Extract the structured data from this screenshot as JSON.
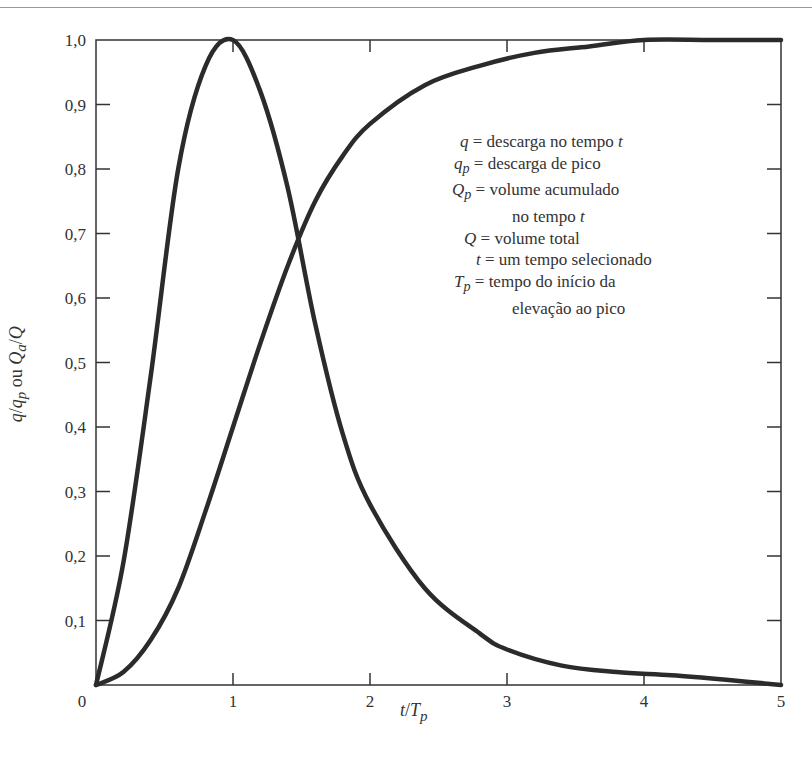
{
  "chart_data": {
    "type": "line",
    "title": "",
    "xlabel": "t/T_p",
    "ylabel": "q/q_p ou Q_a/Q",
    "xlim": [
      0,
      5
    ],
    "ylim": [
      0,
      1.0
    ],
    "grid": false,
    "x_ticks": [
      "0",
      "1",
      "2",
      "3",
      "4",
      "5"
    ],
    "y_ticks": [
      "0,1",
      "0,2",
      "0,3",
      "0,4",
      "0,5",
      "0,6",
      "0,7",
      "0,8",
      "0,9",
      "1,0"
    ],
    "series": [
      {
        "name": "q/q_p (hidrograma unitário adimensional)",
        "x": [
          0,
          0.2,
          0.4,
          0.6,
          0.8,
          1.0,
          1.2,
          1.4,
          1.6,
          1.8,
          2.0,
          2.4,
          2.8,
          3.0,
          3.4,
          3.8,
          4.2,
          4.6,
          5.0
        ],
        "values": [
          0,
          0.19,
          0.48,
          0.8,
          0.96,
          1.0,
          0.92,
          0.77,
          0.56,
          0.39,
          0.28,
          0.15,
          0.08,
          0.055,
          0.03,
          0.02,
          0.015,
          0.008,
          0.0
        ]
      },
      {
        "name": "Q_a/Q (curva de massa acumulada)",
        "x": [
          0,
          0.2,
          0.4,
          0.6,
          0.8,
          1.0,
          1.2,
          1.4,
          1.6,
          1.8,
          2.0,
          2.4,
          2.8,
          3.2,
          3.6,
          4.0,
          4.5,
          5.0
        ],
        "values": [
          0,
          0.02,
          0.07,
          0.15,
          0.27,
          0.4,
          0.53,
          0.65,
          0.75,
          0.82,
          0.87,
          0.93,
          0.96,
          0.98,
          0.99,
          1.0,
          1.0,
          1.0
        ]
      }
    ],
    "legend_position": "upper right (inside plot)",
    "annotations": [
      "q = descarga no tempo t",
      "q_p = descarga de pico",
      "Q_p = volume acumulado no tempo t",
      "Q = volume total",
      "t = um tempo selecionado",
      "T_p = tempo do início da elevação ao pico"
    ]
  },
  "labels": {
    "ylabel_parts": [
      "q",
      "/",
      "q",
      "p",
      " ou ",
      "Q",
      "a",
      "/",
      "Q"
    ],
    "xlabel_parts": [
      "t",
      "/",
      "T",
      "p"
    ],
    "x_ticks": [
      "0",
      "1",
      "2",
      "3",
      "4",
      "5"
    ],
    "y_ticks": [
      "0,1",
      "0,2",
      "0,3",
      "0,4",
      "0,5",
      "0,6",
      "0,7",
      "0,8",
      "0,9",
      "1,0"
    ]
  },
  "legend": [
    {
      "sym": "q",
      "sub": "",
      "pad": "",
      "text": "descarga no tempo",
      "var": "t"
    },
    {
      "sym": "q",
      "sub": "p",
      "pad": "",
      "text": "descarga de pico",
      "var": ""
    },
    {
      "sym": "Q",
      "sub": "p",
      "pad": "",
      "text": "volume acumulado",
      "var": ""
    },
    {
      "sym": "",
      "sub": "",
      "pad": "",
      "text": "no tempo",
      "var": "t"
    },
    {
      "sym": "Q",
      "sub": "",
      "pad": "",
      "text": "volume total",
      "var": ""
    },
    {
      "sym": "t",
      "sub": "",
      "pad": "",
      "text": "um tempo selecionado",
      "var": ""
    },
    {
      "sym": "T",
      "sub": "p",
      "pad": "",
      "text": "tempo do início da",
      "var": ""
    },
    {
      "sym": "",
      "sub": "",
      "pad": "",
      "text": "elevação ao pico",
      "var": ""
    }
  ]
}
